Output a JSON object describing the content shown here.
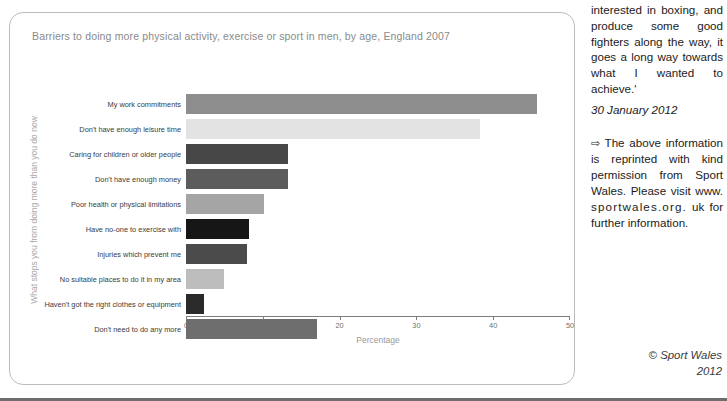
{
  "chart": {
    "title": "Barriers to doing more physical activity, exercise or sport in men, by age, England 2007",
    "y_axis_title": "What stops you from doing more than you do now",
    "x_axis_title": "Percentage"
  },
  "chart_data": {
    "type": "bar",
    "orientation": "horizontal",
    "title": "Barriers to doing more physical activity, exercise or sport in men, by age, England 2007",
    "xlabel": "Percentage",
    "ylabel": "What stops you from doing more than you do now",
    "xlim": [
      0,
      50
    ],
    "xticks": [
      0,
      10,
      20,
      30,
      40,
      50
    ],
    "xtick_labels": [
      "0",
      "10",
      "20",
      "30",
      "40",
      "50"
    ],
    "grid": false,
    "legend": false,
    "categories": [
      "My work commitments",
      "Don't have enough leisure time",
      "Caring for children or older people",
      "Don't have enough money",
      "Poor health or physical limitations",
      "Have no-one to exercise with",
      "Injuries which prevent me",
      "No suitable places to do it in my area",
      "Haven't got the right clothes or equipment",
      "Don't need to do any more"
    ],
    "values": [
      45.7,
      38.3,
      13.3,
      13.3,
      10.2,
      8.2,
      8.0,
      5.0,
      2.3,
      17.0
    ],
    "bar_colors": [
      "#8d8d8d",
      "#e3e3e3",
      "#474747",
      "#5c5c5c",
      "#a5a5a5",
      "#161616",
      "#4b4b4b",
      "#bdbdbd",
      "#2a2a2a",
      "#6e6e6e"
    ]
  },
  "article": {
    "quote_paragraph": "interested in boxing, and produce some good fighters along the way, it goes a long way towards what I wanted to achieve.'",
    "date": "30 January 2012",
    "arrow_icon": "⇨",
    "note_part1": "The above information is reprinted with kind permission from Sport Wales. Please visit www.",
    "note_url": "sportwales.org.",
    "note_part2": "uk for further information.",
    "copyright_line1": "© Sport Wales",
    "copyright_line2": "2012"
  }
}
